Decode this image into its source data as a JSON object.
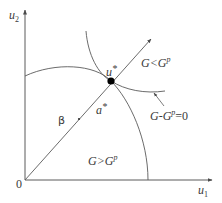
{
  "axes": {
    "y_label": {
      "base": "u",
      "sub": "2"
    },
    "x_label": {
      "base": "u",
      "sub": "1"
    },
    "origin_label": "0"
  },
  "points": {
    "optimum": {
      "label_base": "u",
      "label_sup": "*"
    },
    "a_star": {
      "label_base": "a",
      "label_sup": "*"
    }
  },
  "ray_label": "β",
  "regions": {
    "less": {
      "left": "G<G",
      "sup": "p"
    },
    "greater": {
      "left": "G>G",
      "sup": "p"
    }
  },
  "boundary_label": {
    "left": "G-G",
    "sup": "p",
    "right": "=0"
  },
  "colors": {
    "line": "#5a5a5a",
    "dot": "#000000",
    "text": "#3a3a3a"
  }
}
